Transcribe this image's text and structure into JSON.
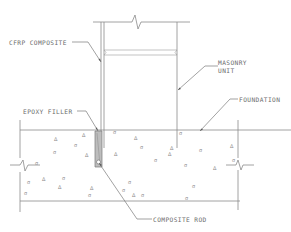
{
  "drawing": {
    "title": "CFRP composite rod anchorage detail at masonry-foundation interface",
    "colors": {
      "line": "#8a8a8a",
      "text": "#6b6b6b",
      "filler": "#b8b8b8",
      "background": "#ffffff"
    }
  },
  "labels": {
    "cfrp_composite": "CFRP COMPOSITE",
    "masonry_unit_line1": "MASONRY",
    "masonry_unit_line2": "UNIT",
    "foundation": "FOUNDATION",
    "epoxy_filler": "EPOXY FILLER",
    "composite_rod": "COMPOSITE ROD"
  },
  "components": [
    {
      "name": "masonry-wall",
      "label": "MASONRY UNIT"
    },
    {
      "name": "cfrp-strip",
      "label": "CFRP COMPOSITE"
    },
    {
      "name": "foundation-slab",
      "label": "FOUNDATION"
    },
    {
      "name": "epoxy-filled-groove",
      "label": "EPOXY FILLER"
    },
    {
      "name": "composite-rod",
      "label": "COMPOSITE ROD"
    }
  ]
}
